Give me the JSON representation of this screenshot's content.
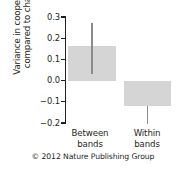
{
  "figure": {
    "credit": "© 2012 Nature Publishing Group"
  },
  "chart_data": {
    "type": "bar",
    "title": "",
    "xlabel": "",
    "ylabel": "Variance in cooperation compared to chance",
    "ylabel_line1": "Variance in cooperation",
    "ylabel_line2": "compared to chance",
    "categories": [
      "Between bands",
      "Within bands"
    ],
    "category_lines": [
      [
        "Between",
        "bands"
      ],
      [
        "Within",
        "bands"
      ]
    ],
    "values": [
      0.163,
      -0.12
    ],
    "errors_low": [
      0.03,
      -0.205
    ],
    "errors_high": [
      0.27,
      -0.12
    ],
    "ylim": [
      -0.2,
      0.3
    ],
    "yticks": [
      0.3,
      0.2,
      0.1,
      0.0,
      -0.1,
      -0.2
    ],
    "ytick_labels": [
      "0.3",
      "0.2",
      "0.1",
      "0.0",
      "−0.1",
      "−0.2"
    ],
    "grid": false,
    "legend": "none",
    "bar_color": "#d5d5d5",
    "error_color": "#8c8c8c",
    "axis_color": "#231f20",
    "zero_line": 0.0
  }
}
